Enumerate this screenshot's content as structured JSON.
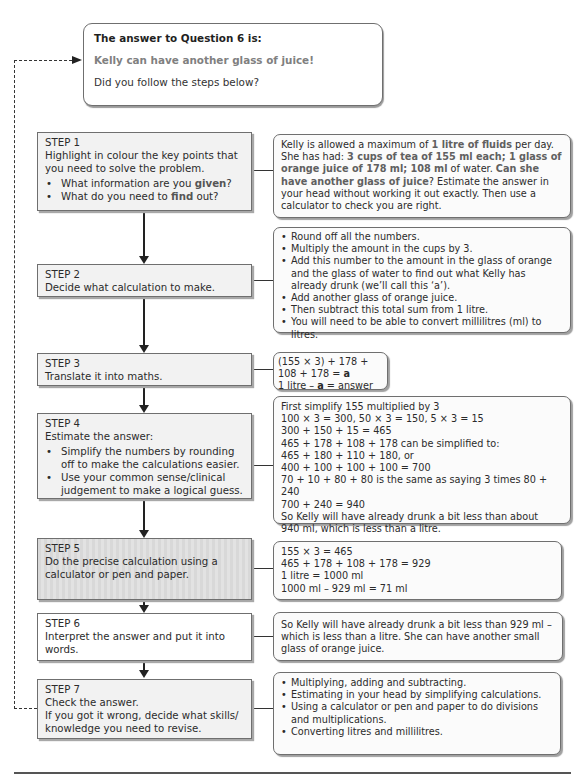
{
  "answer_box": {
    "title": "The answer to Question 6 is:",
    "answer": "Kelly can have another glass of juice!",
    "question": "Did you follow the steps below?"
  },
  "steps": [
    {
      "label": "STEP 1",
      "text": "Highlight in colour the key points that you need to solve the problem.",
      "bullets": [
        {
          "pre": "What information are you ",
          "bold": "given",
          "post": "?"
        },
        {
          "pre": "What do you need to ",
          "bold": "find",
          "post": " out?"
        }
      ],
      "detail": {
        "segments": [
          {
            "t": "Kelly is allowed a maximum of ",
            "b": false
          },
          {
            "t": "1 litre of fluids",
            "b": true
          },
          {
            "t": " per day. She has had: ",
            "b": false
          },
          {
            "t": "3 cups of tea of 155 ml each; 1 glass of orange juice of 178 ml; 108 ml",
            "b": true
          },
          {
            "t": " of water. ",
            "b": false
          },
          {
            "t": "Can she have another glass of juice",
            "b": true
          },
          {
            "t": "? Estimate the answer in your head without working it out exactly. Then use a calculator to check you are right.",
            "b": false
          }
        ]
      }
    },
    {
      "label": "STEP 2",
      "text": "Decide what calculation to make.",
      "detail": {
        "bullets": [
          "Round off all the numbers.",
          "Multiply the amount in the cups by 3.",
          "Add this number to the amount in the glass of orange and the glass of water to find out what Kelly has already drunk (we’ll call this ‘a’).",
          "Add another glass of orange juice.",
          "Then subtract this total sum from 1 litre.",
          "You will need to be able to convert millilitres (ml) to litres."
        ]
      }
    },
    {
      "label": "STEP 3",
      "text": "Translate it into maths.",
      "detail": {
        "line1": "(155 × 3) + 178 + 108 + 178 = ",
        "line1_var": "a",
        "line2_pre": "1 litre – ",
        "line2_var": "a",
        "line2_post": " = answer"
      }
    },
    {
      "label": "STEP 4",
      "text": "Estimate the answer:",
      "bullets": [
        "Simplify the numbers by rounding off to make the calculations easier.",
        "Use your common sense/clinical judgement to make a logical guess."
      ],
      "detail": {
        "lines": [
          "First simplify 155 multiplied by 3",
          "100 × 3 = 300, 50 × 3 = 150, 5 × 3 = 15",
          "300 + 150 + 15 = 465",
          "465 + 178 + 108 + 178 can be simplified to:",
          "465 + 180 + 110 + 180, or",
          "400 + 100 + 100 + 100 = 700",
          "70 + 10 + 80 + 80 is the same as saying 3 times 80 + 240",
          "700 + 240 = 940",
          "So Kelly will have already drunk a bit less than about",
          "940 ml, which is less than a litre."
        ]
      }
    },
    {
      "label": "STEP 5",
      "text": "Do the precise calculation using a calculator or pen and paper.",
      "detail": {
        "lines": [
          "155 × 3 = 465",
          "465 + 178 + 108 + 178 = 929",
          "1 litre = 1000 ml",
          "1000 ml – 929 ml = 71 ml"
        ]
      }
    },
    {
      "label": "STEP 6",
      "text": "Interpret the answer and put it into words.",
      "detail": {
        "text": "So Kelly will have already drunk a bit less than 929 ml – which is less than a litre. She can have another small glass of orange juice."
      }
    },
    {
      "label": "STEP 7",
      "text": "Check the answer.",
      "text2": "If you got it wrong, decide what skills/ knowledge you need to revise.",
      "detail": {
        "bullets": [
          "Multiplying, adding and subtracting.",
          "Estimating in your head by simplifying calculations.",
          "Using a calculator or pen and paper to do divisions and multiplications.",
          "Converting litres and millilitres."
        ]
      }
    }
  ]
}
